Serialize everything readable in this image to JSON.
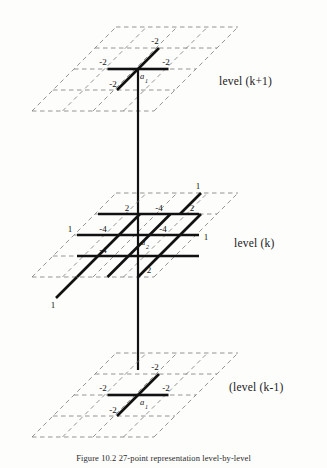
{
  "figure": {
    "caption": "Figure 10.2   27-point representation level-by-level",
    "background_color": "#fdfdfc",
    "stencil_color": "#111111",
    "grid_color": "#7a7a7a"
  },
  "levels": [
    {
      "id": "level-k-plus-1",
      "label": "level (k+1)",
      "center_node": "a",
      "center_subscript": "1",
      "weights": {
        "up_right_diagonal": "-2",
        "left": "-2",
        "right": "-2",
        "down_left_diagonal": "-2"
      },
      "weight_list": [
        "-2",
        "-2",
        "-2",
        "-2"
      ]
    },
    {
      "id": "level-k",
      "label": "level (k)",
      "center_node": "a",
      "center_subscript": "2",
      "weights": {
        "top_left_corner": "2",
        "top_middle": "-4",
        "top_right_corner": "2",
        "left_outer": "1",
        "left_inner": "-4",
        "right_inner": "-4",
        "right_outer": "1",
        "bottom_left_inner": "-4",
        "bottom_right": "2",
        "far_bottom_left": "1",
        "far_top_right": "1"
      },
      "weight_list": [
        "1",
        "2",
        "-4",
        "2",
        "1",
        "-4",
        "-4",
        "1",
        "-4",
        "2",
        "1"
      ]
    },
    {
      "id": "level-k-minus-1",
      "label": "(level (k-1)",
      "center_node": "a",
      "center_subscript": "1",
      "weights": {
        "up_right_diagonal": "-2",
        "left": "-2",
        "right": "-2",
        "down_left_diagonal": "-2"
      },
      "weight_list": [
        "-2",
        "-2",
        "-2",
        "-2"
      ]
    }
  ]
}
